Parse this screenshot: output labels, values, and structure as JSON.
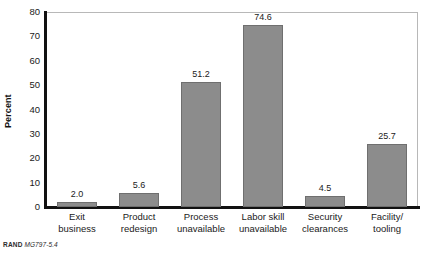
{
  "chart_data": {
    "type": "bar",
    "title": "",
    "subtitle": "",
    "xlabel": "",
    "ylabel": "Percent",
    "categories": [
      "Exit business",
      "Product redesign",
      "Process unavailable",
      "Labor skill unavailable",
      "Security clearances",
      "Facility/ tooling"
    ],
    "category_lines": [
      [
        "Exit",
        "business"
      ],
      [
        "Product",
        "redesign"
      ],
      [
        "Process",
        "unavailable"
      ],
      [
        "Labor skill",
        "unavailable"
      ],
      [
        "Security",
        "clearances"
      ],
      [
        "Facility/",
        "tooling"
      ]
    ],
    "values": [
      2.0,
      5.6,
      51.2,
      74.6,
      4.5,
      25.7
    ],
    "value_labels": [
      "2.0",
      "5.6",
      "51.2",
      "74.6",
      "4.5",
      "25.7"
    ],
    "ylim": [
      0,
      80
    ],
    "ytick_labels": [
      "0",
      "10",
      "20",
      "30",
      "40",
      "50",
      "60",
      "70",
      "80"
    ],
    "yticks": [
      0,
      10,
      20,
      30,
      40,
      50,
      60,
      70,
      80
    ],
    "grid": false,
    "legend": false,
    "legend_position": "none",
    "bar_color": "#8c8c8c",
    "bar_edge_color": "#6f6f6f",
    "axis_color": "#111111",
    "frame_color": "#b8b8b8",
    "background_color": "#ffffff"
  },
  "source": {
    "brand": "RAND",
    "figure_id": "MG797-5.4"
  }
}
